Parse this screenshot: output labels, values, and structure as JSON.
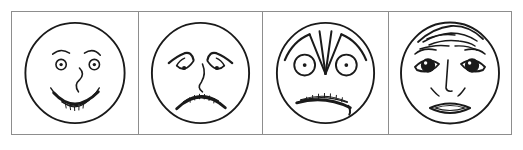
{
  "figure": {
    "type": "line-drawing-panel-strip",
    "panel_count": 4,
    "background_color": "#ffffff",
    "ink_color": "#1a1a1a",
    "border_color": "#8d8d8d"
  },
  "panels": [
    {
      "index": 1,
      "emotion": "happy",
      "label": "Happy face",
      "features": "round face, arched eyebrows, small round eyes with dot pupils, curved nose, wide upturned smile with teeth, cheek lines"
    },
    {
      "index": 2,
      "emotion": "sad",
      "label": "Sad face",
      "features": "round face, drooping outer eyebrows, downcast eyes with dot pupils, curved nose, downturned frowning mouth with teeth"
    },
    {
      "index": 3,
      "emotion": "angry",
      "label": "Angry face",
      "features": "round face, four sharp radiating brow lines converging at center, narrowed round eyes with dot pupils, straight gritted mouth with teeth"
    },
    {
      "index": 4,
      "emotion": "fearful",
      "label": "Fearful face",
      "features": "round face, wavy forehead wrinkles, wide open eyes with large dark irises and highlights, long nose, small open oval mouth"
    }
  ]
}
